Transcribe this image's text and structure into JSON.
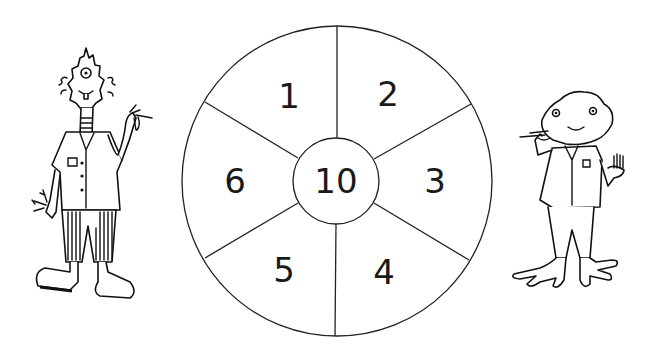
{
  "target": {
    "segments": [
      {
        "label": "1",
        "x": 289,
        "y": 96
      },
      {
        "label": "2",
        "x": 388,
        "y": 94
      },
      {
        "label": "3",
        "x": 435,
        "y": 181
      },
      {
        "label": "4",
        "x": 384,
        "y": 272
      },
      {
        "label": "5",
        "x": 284,
        "y": 270
      },
      {
        "label": "6",
        "x": 235,
        "y": 181
      }
    ],
    "bullseye": {
      "label": "10"
    }
  },
  "characters": {
    "left": "spiky-haired one-eyed alien holding darts",
    "right": "round-headed alien with webbed feet holding darts"
  },
  "colors": {
    "ink": "#111111",
    "background": "#ffffff"
  }
}
